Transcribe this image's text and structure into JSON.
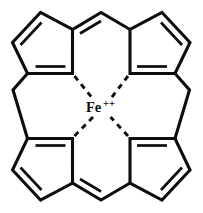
{
  "figure": {
    "name": "metal-cyclopentadienyl-complex",
    "kind": "chemical-structure-diagram",
    "background_color": "#ffffff",
    "line_color": "#0d0d0d",
    "width": 203,
    "height": 213
  },
  "metal_center": {
    "symbol": "Fe",
    "charge": "++",
    "charge_sign": "+",
    "charge_count": 2,
    "label_full": "Fe++",
    "x": 101,
    "y": 108
  },
  "ligands": [
    {
      "id": "ring-top-left",
      "label": "cyclopentadienyl",
      "position": "top-left",
      "double_bonds": 2
    },
    {
      "id": "ring-top-right",
      "label": "cyclopentadienyl",
      "position": "top-right",
      "double_bonds": 2
    },
    {
      "id": "ring-bottom-left",
      "label": "cyclopentadienyl",
      "position": "bottom-left",
      "double_bonds": 2
    },
    {
      "id": "ring-bottom-right",
      "label": "cyclopentadienyl",
      "position": "bottom-right",
      "double_bonds": 2
    }
  ],
  "coordination_bonds": [
    {
      "id": "coord-top-left",
      "from": "ring-top-left",
      "to": "metal-center",
      "style": "dashed"
    },
    {
      "id": "coord-top-right",
      "from": "ring-top-right",
      "to": "metal-center",
      "style": "dashed"
    },
    {
      "id": "coord-bottom-left",
      "from": "ring-bottom-left",
      "to": "metal-center",
      "style": "dashed"
    },
    {
      "id": "coord-bottom-right",
      "from": "ring-bottom-right",
      "to": "metal-center",
      "style": "dashed"
    }
  ]
}
